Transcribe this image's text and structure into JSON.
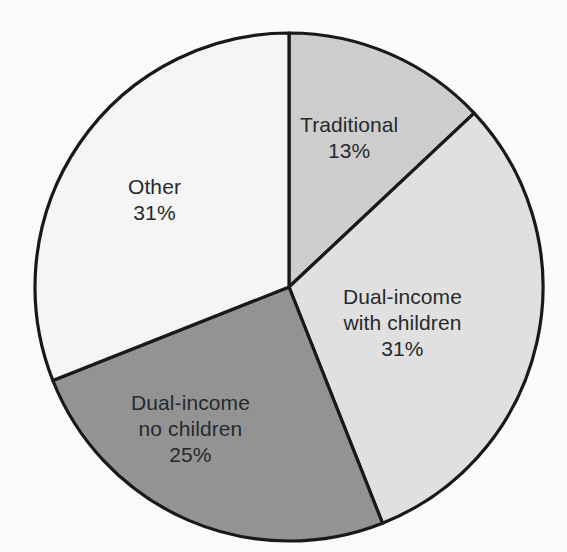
{
  "chart_data": {
    "type": "pie",
    "title": "",
    "subtitle": "",
    "xlabel": "",
    "ylabel": "",
    "legend_position": "none",
    "labels_inside_slices": true,
    "start_angle_deg": 0,
    "direction": "clockwise",
    "categories": [
      "Traditional",
      "Dual-income with children",
      "Dual-income no children",
      "Other"
    ],
    "values": [
      13,
      31,
      25,
      31
    ],
    "value_unit": "%",
    "slices": [
      {
        "name": "Traditional",
        "label_lines": [
          "Traditional"
        ],
        "value": 13,
        "value_text": "13%",
        "color": "#cfcfcf",
        "start_deg": 0,
        "end_deg": 46.8
      },
      {
        "name": "Dual-income with children",
        "label_lines": [
          "Dual-income",
          "with children"
        ],
        "value": 31,
        "value_text": "31%",
        "color": "#e2e2e2",
        "start_deg": 46.8,
        "end_deg": 158.4
      },
      {
        "name": "Dual-income no children",
        "label_lines": [
          "Dual-income",
          "no children"
        ],
        "value": 25,
        "value_text": "25%",
        "color": "#949494",
        "start_deg": 158.4,
        "end_deg": 248.4
      },
      {
        "name": "Other",
        "label_lines": [
          "Other"
        ],
        "value": 31,
        "value_text": "31%",
        "color": "#f7f7f7",
        "start_deg": 248.4,
        "end_deg": 360
      }
    ],
    "geometry": {
      "center_x": 289,
      "center_y": 287,
      "radius": 254
    },
    "outline_color": "#16181a",
    "background_color": "#fdfdfd"
  },
  "labels": {
    "traditional": {
      "line1": "Traditional",
      "value": "13%"
    },
    "dual_with_children": {
      "line1": "Dual-income",
      "line2": "with children",
      "value": "31%"
    },
    "dual_no_children": {
      "line1": "Dual-income",
      "line2": "no children",
      "value": "25%"
    },
    "other": {
      "line1": "Other",
      "value": "31%"
    }
  }
}
